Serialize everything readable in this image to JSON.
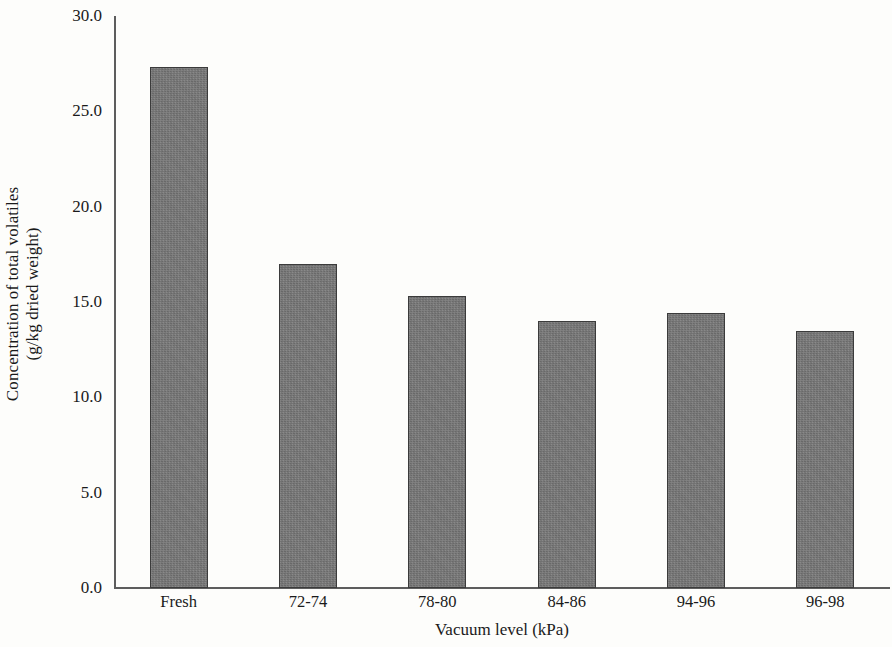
{
  "chart_data": {
    "type": "bar",
    "title": "",
    "subtitle": "",
    "xlabel": "Vacuum level (kPa)",
    "ylabel": "Concentration of total volatiles (g/kg dried weight)",
    "ylabel_lines": [
      "Concentration of total volatiles",
      "(g/kg dried weight)"
    ],
    "categories": [
      "Fresh",
      "72-74",
      "78-80",
      "84-86",
      "94-96",
      "96-98"
    ],
    "values": [
      27.3,
      17.0,
      15.3,
      14.0,
      14.4,
      13.5
    ],
    "ylim": [
      0.0,
      30.0
    ],
    "ytick_step": 5.0,
    "ytick_labels": [
      "30.0",
      "25.0",
      "20.0",
      "15.0",
      "10.0",
      "5.0",
      "0.0"
    ],
    "ytick_values": [
      30.0,
      25.0,
      20.0,
      15.0,
      10.0,
      5.0,
      0.0
    ],
    "grid": false,
    "legend": null,
    "legend_position": "none",
    "bar_fill_color": "#787878",
    "bar_border_color": "#3b3b3b",
    "axis_color": "#5d5d5d",
    "background_color": "#fdfdfb",
    "text_color": "#1a1a1a",
    "annotations": []
  }
}
